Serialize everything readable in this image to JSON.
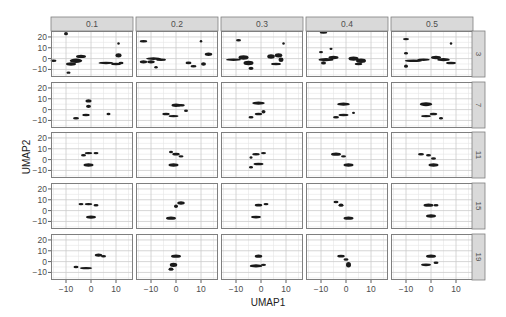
{
  "chart_data": {
    "type": "scatter",
    "title": "",
    "xlabel": "UMAP1",
    "ylabel": "UMAP2",
    "facet_cols_label": "min_dist",
    "facet_rows_label": "n_neighbors",
    "col_strips": [
      "0.1",
      "0.2",
      "0.3",
      "0.4",
      "0.5"
    ],
    "row_strips": [
      "3",
      "7",
      "11",
      "15",
      "19"
    ],
    "xlim": [
      -16,
      16.8
    ],
    "ylim": [
      -17,
      25.5
    ],
    "x_ticks": [
      -10,
      0,
      10
    ],
    "x_tick_labels": [
      "−10",
      "0",
      "10"
    ],
    "y_ticks": [
      -10,
      0,
      10,
      20
    ],
    "y_tick_labels": [
      "−10",
      "0",
      "10",
      "20"
    ],
    "grid": true,
    "legend": "none",
    "panels": [
      {
        "row": "3",
        "col": "0.1",
        "clusters": [
          [
            -15,
            -2,
            1.2,
            0.8
          ],
          [
            -10,
            23,
            0.8,
            1.5
          ],
          [
            -8,
            -5,
            2,
            1.5
          ],
          [
            -6,
            -2,
            2.5,
            2
          ],
          [
            -4,
            2,
            2,
            1.5
          ],
          [
            -9,
            -13,
            0.8,
            0.8
          ],
          [
            6,
            -4,
            3,
            0.8
          ],
          [
            10,
            -5,
            2,
            0.8
          ],
          [
            12,
            -4,
            1,
            0.8
          ],
          [
            11,
            3,
            1.2,
            2
          ],
          [
            11,
            14,
            0.5,
            0.6
          ]
        ]
      },
      {
        "row": "3",
        "col": "0.2",
        "clusters": [
          [
            -13,
            16,
            1.5,
            0.6
          ],
          [
            -13,
            -3,
            1.5,
            1.5
          ],
          [
            -9,
            0,
            3,
            1.2
          ],
          [
            -10,
            -3,
            1.5,
            1.5
          ],
          [
            -6,
            -1,
            2,
            1
          ],
          [
            -8,
            -8,
            0.7,
            1
          ],
          [
            5,
            -4,
            1.2,
            1.2
          ],
          [
            7,
            -7,
            1.2,
            1
          ],
          [
            11,
            -5,
            1,
            1.5
          ],
          [
            13,
            4,
            1.5,
            1.5
          ],
          [
            10,
            16,
            0.5,
            0.6
          ]
        ]
      },
      {
        "row": "3",
        "col": "0.3",
        "clusters": [
          [
            -9,
            17,
            1,
            0.8
          ],
          [
            -11,
            -1,
            3,
            1
          ],
          [
            -7,
            1,
            2,
            2
          ],
          [
            -5,
            -4,
            2,
            2
          ],
          [
            -4,
            -9,
            1,
            1.5
          ],
          [
            4,
            2,
            1.5,
            2
          ],
          [
            7,
            3,
            1.5,
            2
          ],
          [
            6,
            -5,
            2,
            1
          ],
          [
            8,
            -1,
            1,
            2
          ],
          [
            9,
            14,
            0.5,
            0.6
          ]
        ]
      },
      {
        "row": "3",
        "col": "0.4",
        "clusters": [
          [
            -9,
            24,
            1.5,
            0.6
          ],
          [
            -10,
            6,
            0.8,
            0.6
          ],
          [
            -6,
            9,
            0.6,
            0.6
          ],
          [
            -8,
            -1,
            3,
            1.5
          ],
          [
            -5,
            1,
            2,
            1.5
          ],
          [
            -9,
            -4,
            1,
            1.5
          ],
          [
            3,
            0,
            2,
            2
          ],
          [
            6,
            -2,
            2,
            2
          ],
          [
            5,
            -5,
            1.5,
            1
          ]
        ]
      },
      {
        "row": "3",
        "col": "0.5",
        "clusters": [
          [
            -10,
            18,
            1.2,
            1
          ],
          [
            -10,
            5,
            0.8,
            0.8
          ],
          [
            -7,
            -2,
            3.5,
            1.2
          ],
          [
            -3,
            -1,
            2.5,
            1
          ],
          [
            -10,
            -7,
            0.8,
            1.5
          ],
          [
            2,
            1,
            2,
            1.5
          ],
          [
            5,
            -1,
            2.5,
            1.5
          ],
          [
            8,
            -4,
            2,
            1
          ],
          [
            8,
            14,
            0.5,
            0.8
          ]
        ]
      },
      {
        "row": "7",
        "col": "0.1",
        "clusters": [
          [
            -1,
            8,
            1.2,
            1.5
          ],
          [
            -1,
            3,
            1,
            1.5
          ],
          [
            -6,
            -8,
            1.2,
            1
          ],
          [
            -2,
            -5,
            1.5,
            1
          ],
          [
            7,
            -4,
            0.8,
            0.8
          ]
        ]
      },
      {
        "row": "7",
        "col": "0.2",
        "clusters": [
          [
            -4,
            -4,
            1.5,
            1
          ],
          [
            -1,
            -6,
            2,
            1
          ],
          [
            0,
            4,
            1.8,
            1.5
          ],
          [
            2,
            4,
            1.5,
            1.2
          ],
          [
            4,
            -1,
            0.8,
            0.8
          ]
        ]
      },
      {
        "row": "7",
        "col": "0.3",
        "clusters": [
          [
            -1,
            6,
            2.5,
            1.5
          ],
          [
            -4,
            -7,
            1,
            1
          ],
          [
            -1,
            -4,
            1.5,
            1
          ],
          [
            1,
            -2,
            0.8,
            1.5
          ]
        ]
      },
      {
        "row": "7",
        "col": "0.4",
        "clusters": [
          [
            -1,
            5,
            2.5,
            1.5
          ],
          [
            -4,
            -7,
            1.2,
            1
          ],
          [
            -1,
            -5,
            2,
            1
          ],
          [
            3,
            -3,
            0.6,
            0.6
          ]
        ]
      },
      {
        "row": "7",
        "col": "0.5",
        "clusters": [
          [
            -2,
            5,
            2.5,
            1.8
          ],
          [
            -2,
            -6,
            2,
            1
          ],
          [
            1,
            -4,
            1.5,
            1
          ],
          [
            4,
            -8,
            0.8,
            0.6
          ]
        ]
      },
      {
        "row": "11",
        "col": "0.1",
        "clusters": [
          [
            -3,
            4,
            1,
            1
          ],
          [
            -1,
            6,
            1.5,
            1
          ],
          [
            2,
            6,
            1,
            1
          ],
          [
            -1,
            -5,
            2,
            1.5
          ]
        ]
      },
      {
        "row": "11",
        "col": "0.2",
        "clusters": [
          [
            -2,
            7,
            0.8,
            1
          ],
          [
            0,
            5,
            1.5,
            1.2
          ],
          [
            2,
            3,
            1,
            1
          ],
          [
            -1,
            -5,
            2,
            1.5
          ]
        ]
      },
      {
        "row": "11",
        "col": "0.3",
        "clusters": [
          [
            -4,
            2,
            0.6,
            0.8
          ],
          [
            -2,
            5,
            1.5,
            1
          ],
          [
            1,
            6,
            1,
            1
          ],
          [
            -1,
            -4,
            2,
            1
          ],
          [
            -4,
            -7,
            0.8,
            0.8
          ]
        ]
      },
      {
        "row": "11",
        "col": "0.4",
        "clusters": [
          [
            -4,
            5,
            2,
            1.5
          ],
          [
            -1,
            3,
            1,
            1
          ],
          [
            1,
            -5,
            2,
            1.5
          ]
        ]
      },
      {
        "row": "11",
        "col": "0.5",
        "clusters": [
          [
            -4,
            5,
            1.2,
            1
          ],
          [
            -1,
            4,
            1,
            1
          ],
          [
            1,
            1,
            1,
            1
          ],
          [
            1,
            -5,
            2,
            1.5
          ]
        ]
      },
      {
        "row": "15",
        "col": "0.1",
        "clusters": [
          [
            -4,
            6,
            1,
            0.6
          ],
          [
            -1,
            6,
            1.5,
            1
          ],
          [
            2,
            5,
            1,
            1
          ],
          [
            0,
            -6,
            2,
            1.5
          ]
        ]
      },
      {
        "row": "15",
        "col": "0.2",
        "clusters": [
          [
            0,
            4,
            0.8,
            1.5
          ],
          [
            2,
            7,
            1.5,
            1.5
          ],
          [
            -2,
            -7,
            2,
            1.5
          ]
        ]
      },
      {
        "row": "15",
        "col": "0.3",
        "clusters": [
          [
            -1,
            5,
            1.5,
            1.2
          ],
          [
            2,
            6,
            1,
            1
          ],
          [
            -2,
            -6,
            2,
            1.2
          ]
        ]
      },
      {
        "row": "15",
        "col": "0.4",
        "clusters": [
          [
            -4,
            8,
            1,
            1
          ],
          [
            -2,
            5,
            1,
            1.5
          ],
          [
            1,
            -7,
            2,
            1.5
          ]
        ]
      },
      {
        "row": "15",
        "col": "0.5",
        "clusters": [
          [
            -1,
            5,
            2,
            1.5
          ],
          [
            2,
            5,
            1,
            1
          ],
          [
            0,
            -5,
            2,
            1.5
          ]
        ]
      },
      {
        "row": "19",
        "col": "0.1",
        "clusters": [
          [
            3,
            6,
            1.5,
            1.5
          ],
          [
            5,
            5,
            1,
            1
          ],
          [
            -6,
            -5,
            1,
            1
          ],
          [
            -2,
            -6,
            2.5,
            1
          ]
        ]
      },
      {
        "row": "19",
        "col": "0.2",
        "clusters": [
          [
            0,
            5,
            2,
            1.5
          ],
          [
            -1,
            -3,
            1.5,
            2
          ],
          [
            -2,
            -7,
            1,
            1.5
          ]
        ]
      },
      {
        "row": "19",
        "col": "0.3",
        "clusters": [
          [
            -1,
            5,
            1.5,
            1.5
          ],
          [
            -2,
            -4,
            2.5,
            1.5
          ],
          [
            1,
            -3,
            1,
            1
          ]
        ]
      },
      {
        "row": "19",
        "col": "0.4",
        "clusters": [
          [
            -2,
            5,
            1.5,
            1.2
          ],
          [
            0,
            2,
            1,
            1
          ],
          [
            1,
            -3,
            1,
            2.5
          ]
        ]
      },
      {
        "row": "19",
        "col": "0.5",
        "clusters": [
          [
            0,
            5,
            2,
            1.5
          ],
          [
            -2,
            -3,
            2,
            1.2
          ],
          [
            2,
            -1,
            1,
            1
          ]
        ]
      }
    ]
  },
  "style": {
    "strip_fill": "#d9d9d9",
    "strip_border": "#7f7f7f",
    "panel_border": "#7f7f7f",
    "grid_major": "#cccccc",
    "grid_minor": "#e6e6e6",
    "point_color": "#1a1a1a",
    "text_color": "#4d4d4d",
    "axis_title_color": "#222222"
  }
}
